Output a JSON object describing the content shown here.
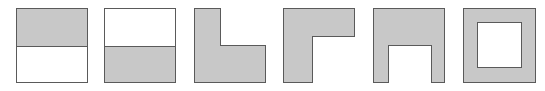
{
  "figure": {
    "shapes": [
      {
        "id": 1,
        "description": "square with top half shaded",
        "shaded": "top-half"
      },
      {
        "id": 2,
        "description": "square with bottom half shaded",
        "shaded": "bottom-half"
      },
      {
        "id": 3,
        "description": "square shaded except top-right quarter",
        "shaded": "L-shape, white top-right"
      },
      {
        "id": 4,
        "description": "square shaded except bottom-right region",
        "shaded": "L-shape, white bottom-right"
      },
      {
        "id": 5,
        "description": "square shaded except bottom-center notch",
        "shaded": "U-shape, white bottom-center"
      },
      {
        "id": 6,
        "description": "square shaded frame with white center",
        "shaded": "frame, white center"
      }
    ],
    "colors": {
      "shade": "#c8c8c8",
      "stroke": "#5a5a5a",
      "background": "#ffffff"
    }
  }
}
